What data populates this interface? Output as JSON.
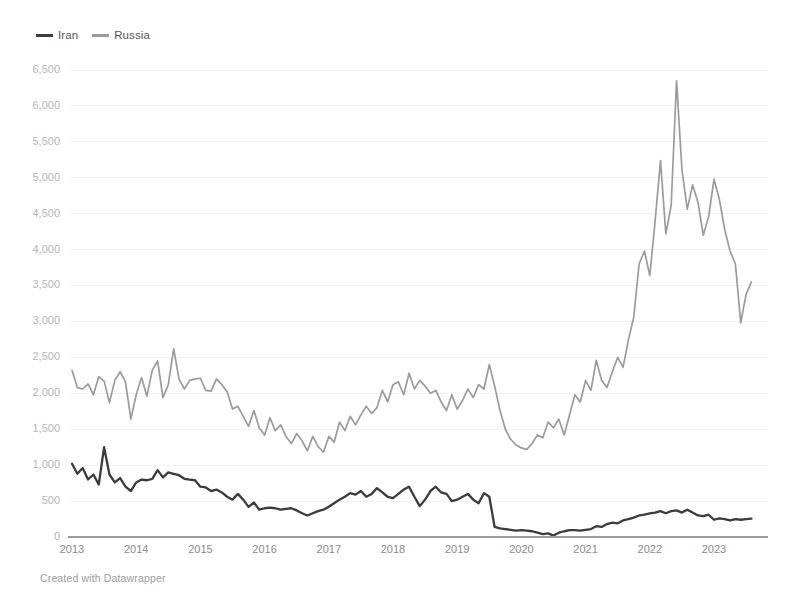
{
  "legend": {
    "position": "top-left",
    "items": [
      {
        "label": "Iran",
        "color": "#3b3b3b",
        "icon": "line-swatch-icon"
      },
      {
        "label": "Russia",
        "color": "#9b9b9b",
        "icon": "line-swatch-icon"
      }
    ]
  },
  "footer": {
    "credit": "Created with Datawrapper"
  },
  "chart_data": {
    "type": "line",
    "title": "",
    "subtitle": "",
    "xlabel": "",
    "ylabel": "",
    "grid": true,
    "legend_position": "top-left",
    "xlim": [
      "2013-01",
      "2023-08"
    ],
    "ylim": [
      0,
      6500
    ],
    "y_ticks": [
      500,
      1000,
      1500,
      2000,
      2500,
      3000,
      3500,
      4000,
      4500,
      5000,
      5500,
      6000,
      6500
    ],
    "y_tick_labels": [
      "500",
      "1,000",
      "1,500",
      "2,000",
      "2,500",
      "3,000",
      "3,500",
      "4,000",
      "4,500",
      "5,000",
      "5,500",
      "6,000",
      "6,500"
    ],
    "zero_label": "0",
    "x_ticks": [
      "2013",
      "2014",
      "2015",
      "2016",
      "2017",
      "2018",
      "2019",
      "2020",
      "2021",
      "2022",
      "2023"
    ],
    "x_tick_labels": [
      "2013",
      "2014",
      "2015",
      "2016",
      "2017",
      "2018",
      "2019",
      "2020",
      "2021",
      "2022",
      "2023"
    ],
    "x_frequency": "monthly",
    "x_start": "2013-01",
    "series": [
      {
        "name": "Iran",
        "color": "#3b3b3b",
        "values": [
          1020,
          880,
          960,
          800,
          870,
          730,
          1250,
          870,
          760,
          820,
          700,
          640,
          760,
          800,
          790,
          810,
          930,
          830,
          900,
          880,
          860,
          810,
          800,
          790,
          700,
          690,
          640,
          660,
          620,
          560,
          520,
          600,
          520,
          420,
          480,
          380,
          400,
          410,
          400,
          380,
          390,
          400,
          370,
          330,
          300,
          330,
          360,
          380,
          420,
          470,
          520,
          560,
          610,
          590,
          640,
          560,
          600,
          680,
          620,
          560,
          540,
          600,
          660,
          700,
          560,
          430,
          520,
          640,
          700,
          620,
          600,
          500,
          520,
          560,
          600,
          520,
          470,
          610,
          560,
          140,
          120,
          110,
          100,
          90,
          95,
          90,
          80,
          60,
          40,
          50,
          20,
          60,
          80,
          95,
          95,
          90,
          100,
          110,
          150,
          140,
          180,
          200,
          190,
          230,
          250,
          270,
          300,
          310,
          330,
          340,
          360,
          330,
          360,
          370,
          340,
          380,
          340,
          300,
          290,
          310,
          240,
          260,
          250,
          230,
          250,
          240,
          250,
          255
        ]
      },
      {
        "name": "Russia",
        "color": "#9b9b9b",
        "values": [
          2320,
          2080,
          2060,
          2130,
          1980,
          2230,
          2170,
          1870,
          2180,
          2300,
          2160,
          1640,
          1980,
          2220,
          1960,
          2320,
          2450,
          1940,
          2120,
          2620,
          2200,
          2060,
          2180,
          2200,
          2210,
          2040,
          2030,
          2200,
          2120,
          2020,
          1780,
          1820,
          1680,
          1540,
          1760,
          1520,
          1420,
          1660,
          1480,
          1560,
          1400,
          1300,
          1440,
          1340,
          1200,
          1400,
          1260,
          1180,
          1400,
          1320,
          1600,
          1480,
          1680,
          1560,
          1700,
          1820,
          1720,
          1800,
          2040,
          1880,
          2120,
          2160,
          1980,
          2280,
          2060,
          2180,
          2100,
          2000,
          2040,
          1880,
          1760,
          1980,
          1780,
          1900,
          2060,
          1940,
          2120,
          2060,
          2400,
          2100,
          1760,
          1500,
          1360,
          1280,
          1240,
          1220,
          1300,
          1420,
          1380,
          1600,
          1520,
          1640,
          1420,
          1700,
          1980,
          1880,
          2180,
          2040,
          2460,
          2180,
          2080,
          2300,
          2500,
          2360,
          2740,
          3060,
          3800,
          3980,
          3640,
          4400,
          5240,
          4220,
          4620,
          6350,
          5120,
          4560,
          4900,
          4660,
          4200,
          4460,
          4980,
          4700,
          4280,
          3980,
          3800,
          2980,
          3380,
          3550
        ]
      }
    ]
  }
}
